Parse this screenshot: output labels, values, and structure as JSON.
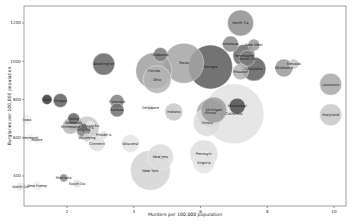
{
  "chart_data": {
    "type": "scatter",
    "subtype": "bubble",
    "title": "",
    "xlabel": "Murders per 100,000 population",
    "ylabel": "Burglaries per 100,000 population",
    "xlim": [
      0.0,
      10.5
    ],
    "ylim": [
      270,
      1290
    ],
    "xticks": [
      2,
      4,
      6,
      8,
      10
    ],
    "yticks": [
      400,
      600,
      800,
      1000,
      1200
    ],
    "grid": false,
    "legend": null,
    "size_encodes": "population",
    "color_encodes": "murder rate (grayscale, darker = higher)",
    "points": [
      {
        "label": "North Ca",
        "x": 7.2,
        "y": 1200,
        "r": 13,
        "shade": "#8e8e8e"
      },
      {
        "label": "Arkansas",
        "x": 6.9,
        "y": 1090,
        "r": 8,
        "shade": "#8a8a8a"
      },
      {
        "label": "New Mexi",
        "x": 7.6,
        "y": 1085,
        "r": 6,
        "shade": "#9a9a9a"
      },
      {
        "label": "South Ca",
        "x": 7.4,
        "y": 1015,
        "r": 8,
        "shade": "#7e7e7e"
      },
      {
        "label": "Tennessee",
        "x": 7.3,
        "y": 1030,
        "r": 11,
        "shade": "#6c6c6c"
      },
      {
        "label": "Louisiana",
        "x": 7.6,
        "y": 960,
        "r": 12,
        "shade": "#5e5e5e"
      },
      {
        "label": "Missouri",
        "x": 7.2,
        "y": 945,
        "r": 8,
        "shade": "#b0b0b0"
      },
      {
        "label": "Oklahoma",
        "x": 8.5,
        "y": 965,
        "r": 9,
        "shade": "#9a9a9a"
      },
      {
        "label": "Nevada",
        "x": 8.8,
        "y": 985,
        "r": 5,
        "shade": "#c8c8c8"
      },
      {
        "label": "Texas",
        "x": 5.5,
        "y": 990,
        "r": 20,
        "shade": "#a4a4a4"
      },
      {
        "label": "Florida",
        "x": 4.6,
        "y": 950,
        "r": 18,
        "shade": "#a0a0a0"
      },
      {
        "label": "Ohio",
        "x": 4.7,
        "y": 905,
        "r": 14,
        "shade": "#b4b4b4"
      },
      {
        "label": "Alabama",
        "x": 4.8,
        "y": 1035,
        "r": 7,
        "shade": "#7a7a7a"
      },
      {
        "label": "Georgia",
        "x": 6.3,
        "y": 970,
        "r": 22,
        "shade": "#5a5a5a"
      },
      {
        "label": "Washington",
        "x": 3.1,
        "y": 985,
        "r": 11,
        "shade": "#666666"
      },
      {
        "label": "Louisiana",
        "x": 9.9,
        "y": 880,
        "r": 11,
        "shade": "#a8a8a8"
      },
      {
        "label": "Maryland",
        "x": 9.9,
        "y": 720,
        "r": 11,
        "shade": "#c8c8c8"
      },
      {
        "label": "Utah",
        "x": 1.4,
        "y": 800,
        "r": 5,
        "shade": "#3a3a3a"
      },
      {
        "label": "Oregon",
        "x": 1.8,
        "y": 795,
        "r": 7,
        "shade": "#606060"
      },
      {
        "label": "Colorado",
        "x": 3.5,
        "y": 790,
        "r": 7,
        "shade": "#808080"
      },
      {
        "label": "Kansas",
        "x": 3.5,
        "y": 745,
        "r": 7,
        "shade": "#707070"
      },
      {
        "label": "Delaware",
        "x": 4.5,
        "y": 755,
        "r": 3,
        "shade": "#e8e8e8"
      },
      {
        "label": "Indiana",
        "x": 5.2,
        "y": 735,
        "r": 9,
        "shade": "#c8c8c8"
      },
      {
        "label": "Michigan",
        "x": 6.4,
        "y": 745,
        "r": 13,
        "shade": "#9c9c9c"
      },
      {
        "label": "Illinois",
        "x": 6.3,
        "y": 730,
        "r": 14,
        "shade": "#a8a8a8"
      },
      {
        "label": "Mississippi",
        "x": 7.1,
        "y": 765,
        "r": 8,
        "shade": "#4e4e4e"
      },
      {
        "label": "California",
        "x": 7.0,
        "y": 725,
        "r": 30,
        "shade": "#e2e2e2"
      },
      {
        "label": "Illinois",
        "x": 6.2,
        "y": 680,
        "r": 14,
        "shade": "#dcdcdc"
      },
      {
        "label": "Iowa",
        "x": 0.8,
        "y": 695,
        "r": 5,
        "shade": "#efefef"
      },
      {
        "label": "Idaho",
        "x": 2.2,
        "y": 700,
        "r": 6,
        "shade": "#707070"
      },
      {
        "label": "Nebraska",
        "x": 2.2,
        "y": 680,
        "r": 8,
        "shade": "#a0a0a0"
      },
      {
        "label": "Minnesota",
        "x": 2.1,
        "y": 660,
        "r": 8,
        "shade": "#b8b8b8"
      },
      {
        "label": "Arizona",
        "x": 2.6,
        "y": 650,
        "r": 12,
        "shade": "#c8c8c8"
      },
      {
        "label": "Virginia",
        "x": 2.5,
        "y": 640,
        "r": 7,
        "shade": "#888888"
      },
      {
        "label": "Rhode Is",
        "x": 3.1,
        "y": 615,
        "r": 4,
        "shade": "#e0e0e0"
      },
      {
        "label": "Wyoming",
        "x": 2.6,
        "y": 600,
        "r": 4,
        "shade": "#d0d0d0"
      },
      {
        "label": "Connecti",
        "x": 2.9,
        "y": 570,
        "r": 8,
        "shade": "#e0e0e0"
      },
      {
        "label": "Wisconsi",
        "x": 3.9,
        "y": 570,
        "r": 9,
        "shade": "#e4e4e4"
      },
      {
        "label": "Vermont",
        "x": 0.9,
        "y": 600,
        "r": 4,
        "shade": "#f0f0f0"
      },
      {
        "label": "Maine",
        "x": 1.1,
        "y": 590,
        "r": 4,
        "shade": "#f0f0f0"
      },
      {
        "label": "Montana",
        "x": 1.9,
        "y": 390,
        "r": 4,
        "shade": "#888888"
      },
      {
        "label": "South Da",
        "x": 2.3,
        "y": 360,
        "r": 4,
        "shade": "#e0e0e0"
      },
      {
        "label": "North Da",
        "x": 0.6,
        "y": 345,
        "r": 4,
        "shade": "#e8e8e8"
      },
      {
        "label": "New Hamp",
        "x": 1.1,
        "y": 348,
        "r": 5,
        "shade": "#f0f0f0"
      },
      {
        "label": "New Jers",
        "x": 4.8,
        "y": 500,
        "r": 13,
        "shade": "#dcdcdc"
      },
      {
        "label": "New York",
        "x": 4.5,
        "y": 430,
        "r": 20,
        "shade": "#d4d4d4"
      },
      {
        "label": "Pennsylv",
        "x": 6.1,
        "y": 515,
        "r": 14,
        "shade": "#dedede"
      },
      {
        "label": "Virginia",
        "x": 6.1,
        "y": 470,
        "r": 11,
        "shade": "#e4e4e4"
      },
      {
        "label": "Massachu",
        "x": 2.7,
        "y": 665,
        "r": 4,
        "shade": "#e6e6e6"
      }
    ]
  },
  "plot": {
    "x0": 24,
    "x1": 346,
    "y0": 6,
    "y1": 206,
    "xpx_a": 2,
    "xpx_a_px": 67,
    "xpx_b": 10,
    "xpx_b_px": 334,
    "ypx_a": 1200,
    "ypx_a_px": 23,
    "ypx_b": 400,
    "ypx_b_px": 176
  }
}
